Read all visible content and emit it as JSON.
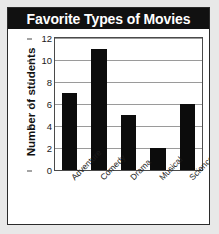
{
  "chart_data": {
    "type": "bar",
    "title": "Favorite Types of Movies",
    "xlabel": "",
    "ylabel": "Number of students",
    "categories": [
      "Adventure",
      "Comedy",
      "Drama",
      "Musical",
      "Science fiction"
    ],
    "values": [
      7,
      11,
      5,
      2,
      6
    ],
    "ylim": [
      0,
      12
    ],
    "ytick_step": 2,
    "yticks": [
      0,
      2,
      4,
      6,
      8,
      10,
      12
    ],
    "ytick_labels": [
      "0",
      "2",
      "4",
      "6",
      "8",
      "10",
      "12"
    ],
    "grid": true,
    "legend": false,
    "bar_color": "#0c0c0c",
    "title_background": "#111111",
    "title_color": "#ffffff",
    "gridline_color": "#9a9a9a",
    "axis_color": "#4a4a4a",
    "plot_background": "#ffffff",
    "page_background": "#e8e8e8"
  }
}
